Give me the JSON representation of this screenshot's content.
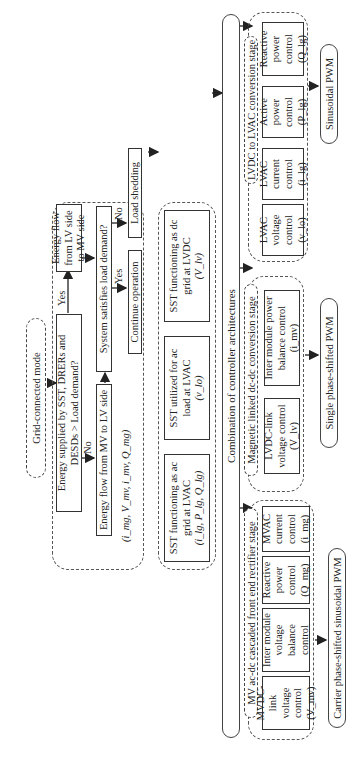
{
  "start": {
    "label": "Grid-connected mode"
  },
  "decision_block": {
    "q1": "Energy supplied by SST, DRERs and DESDs > Load demand?",
    "yes_label": "Yes",
    "no_label": "No",
    "yes_box": "Energy flow from LV side to MV side",
    "no_box": "Energy flow from MV to LV side",
    "q2": "System satisfies load demand?",
    "q2_yes": "Yes",
    "q2_no": "No",
    "q2_yes_box": "Continue operation",
    "q2_no_box": "Load shedding",
    "variables": "(i_mg, V_mv, i_mv, Q_mg)"
  },
  "modes": [
    {
      "label": "SST functioning as ac grid at LVAC",
      "vars": "(i_lg, P_lg, Q_lg)"
    },
    {
      "label": "SST utilized for ac load at LVAC",
      "vars": "(v_lo)"
    },
    {
      "label": "SST functioning as dc grid at LVDC",
      "vars": "(V_lv)"
    }
  ],
  "combination": {
    "label": "Combination of controller architectures"
  },
  "stages": [
    {
      "title": "MV ac-dc cascaded front end rectifier stage",
      "controls": [
        "MVDC-link voltage control (V_mv)",
        "Inter module voltage balance control",
        "Reactive power control (Q_mg)",
        "MVAC current control (i_mg)"
      ],
      "pwm": "Carrier phase-shifted sinusoidal PWM"
    },
    {
      "title": "Magnetic linked dc-dc conversion stage",
      "controls": [
        "LVDC-link voltage control (V_lv)",
        "Inter module power balance control (i_mv)"
      ],
      "pwm": "Single phase-shifted PWM"
    },
    {
      "title": "LVDC to LVAC conversion stage",
      "controls": [
        "LVAC voltage control (v_lo)",
        "LVAC current control (i_lg)",
        "Active power control (P_lg)",
        "Reactive power control (Q_lg)"
      ],
      "pwm": "Sinusoidal PWM"
    }
  ]
}
